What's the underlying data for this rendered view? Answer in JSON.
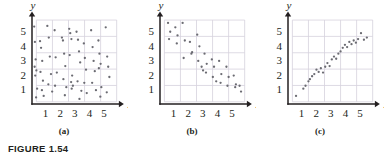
{
  "figure": {
    "caption": "FIGURE 1.54",
    "axis_labels": {
      "x": "x",
      "y": "y"
    },
    "tick_labels": [
      "1",
      "2",
      "3",
      "4",
      "5"
    ],
    "colors": {
      "axis": "#231f20",
      "grid": "#d6d2dd",
      "point": "#6b6b72",
      "text": "#231f20"
    }
  },
  "chart_data": [
    {
      "type": "scatter",
      "title": "(a)",
      "panel": "a",
      "description": "No correlation - points scattered randomly",
      "xlabel": "x",
      "ylabel": "y",
      "xlim": [
        0,
        6
      ],
      "ylim": [
        0,
        6
      ],
      "xticks": [
        1,
        2,
        3,
        4,
        5
      ],
      "yticks": [
        1,
        2,
        3,
        4,
        5
      ],
      "grid": true,
      "legend": "none",
      "points": [
        [
          0.15,
          5.3
        ],
        [
          0.2,
          4.25
        ],
        [
          0.25,
          3.05
        ],
        [
          0.18,
          2.55
        ],
        [
          0.3,
          2.3
        ],
        [
          0.22,
          1.95
        ],
        [
          0.35,
          1.05
        ],
        [
          0.28,
          0.45
        ],
        [
          0.55,
          4.3
        ],
        [
          0.62,
          3.85
        ],
        [
          0.7,
          2.95
        ],
        [
          0.58,
          2.2
        ],
        [
          0.75,
          1.6
        ],
        [
          0.68,
          0.95
        ],
        [
          0.8,
          0.55
        ],
        [
          1.05,
          5.35
        ],
        [
          1.15,
          4.55
        ],
        [
          1.22,
          3.25
        ],
        [
          1.3,
          2.05
        ],
        [
          1.12,
          1.35
        ],
        [
          1.38,
          0.85
        ],
        [
          1.55,
          5.05
        ],
        [
          1.62,
          3.2
        ],
        [
          1.7,
          2.15
        ],
        [
          1.58,
          1.25
        ],
        [
          2.05,
          4.55
        ],
        [
          2.12,
          4.35
        ],
        [
          2.2,
          3.45
        ],
        [
          2.28,
          2.6
        ],
        [
          2.15,
          1.7
        ],
        [
          2.35,
          1.15
        ],
        [
          2.25,
          0.6
        ],
        [
          2.55,
          5.15
        ],
        [
          2.62,
          4.85
        ],
        [
          2.7,
          4.45
        ],
        [
          2.58,
          3.35
        ],
        [
          2.75,
          1.95
        ],
        [
          2.68,
          1.5
        ],
        [
          2.8,
          1.25
        ],
        [
          2.72,
          1.05
        ],
        [
          3.05,
          4.95
        ],
        [
          3.15,
          4.4
        ],
        [
          3.22,
          3.6
        ],
        [
          3.3,
          2.85
        ],
        [
          3.12,
          1.55
        ],
        [
          3.38,
          0.9
        ],
        [
          3.25,
          0.35
        ],
        [
          3.55,
          4.15
        ],
        [
          3.62,
          3.15
        ],
        [
          3.7,
          2.35
        ],
        [
          3.58,
          1.45
        ],
        [
          3.75,
          0.75
        ],
        [
          4.05,
          5.05
        ],
        [
          4.15,
          3.9
        ],
        [
          4.22,
          2.95
        ],
        [
          4.3,
          2.25
        ],
        [
          4.12,
          1.45
        ],
        [
          4.38,
          0.95
        ],
        [
          4.55,
          4.35
        ],
        [
          4.62,
          3.45
        ],
        [
          4.7,
          2.75
        ],
        [
          4.58,
          2.45
        ],
        [
          4.75,
          1.15
        ],
        [
          4.68,
          0.5
        ],
        [
          5.05,
          5.25
        ],
        [
          5.15,
          3.25
        ],
        [
          5.22,
          2.55
        ],
        [
          5.3,
          1.85
        ],
        [
          5.12,
          0.8
        ]
      ]
    },
    {
      "type": "scatter",
      "title": "(b)",
      "panel": "b",
      "description": "Negative correlation - points trend downward left to right",
      "xlabel": "x",
      "ylabel": "y",
      "xlim": [
        0,
        6
      ],
      "ylim": [
        0,
        6
      ],
      "xticks": [
        1,
        2,
        3,
        4,
        5
      ],
      "yticks": [
        1,
        2,
        3,
        4,
        5
      ],
      "grid": true,
      "legend": "none",
      "points": [
        [
          0.55,
          5.55
        ],
        [
          0.7,
          4.95
        ],
        [
          0.62,
          4.45
        ],
        [
          1.05,
          5.25
        ],
        [
          1.2,
          4.7
        ],
        [
          1.15,
          4.15
        ],
        [
          1.55,
          5.55
        ],
        [
          1.7,
          4.35
        ],
        [
          1.62,
          3.15
        ],
        [
          2.05,
          4.25
        ],
        [
          2.2,
          3.55
        ],
        [
          2.15,
          3.45
        ],
        [
          2.55,
          4.75
        ],
        [
          2.7,
          3.95
        ],
        [
          2.62,
          2.95
        ],
        [
          2.85,
          2.55
        ],
        [
          2.95,
          2.3
        ],
        [
          3.05,
          3.45
        ],
        [
          3.2,
          2.75
        ],
        [
          3.15,
          2.15
        ],
        [
          3.55,
          3.05
        ],
        [
          3.7,
          2.55
        ],
        [
          3.62,
          1.85
        ],
        [
          3.85,
          1.55
        ],
        [
          4.05,
          2.95
        ],
        [
          4.2,
          2.05
        ],
        [
          4.15,
          1.45
        ],
        [
          4.55,
          2.55
        ],
        [
          4.7,
          1.85
        ],
        [
          4.62,
          1.25
        ],
        [
          5.05,
          1.95
        ],
        [
          5.2,
          1.35
        ],
        [
          5.15,
          1.15
        ],
        [
          5.45,
          1.25
        ],
        [
          5.55,
          0.85
        ]
      ]
    },
    {
      "type": "scatter",
      "title": "(c)",
      "panel": "c",
      "description": "Strong positive correlation - points trend upward left to right",
      "xlabel": "x",
      "ylabel": "y",
      "xlim": [
        0,
        6
      ],
      "ylim": [
        0,
        6
      ],
      "xticks": [
        1,
        2,
        3,
        4,
        5
      ],
      "yticks": [
        1,
        2,
        3,
        4,
        5
      ],
      "grid": true,
      "legend": "none",
      "points": [
        [
          0.55,
          0.55
        ],
        [
          1.05,
          1.05
        ],
        [
          1.2,
          1.25
        ],
        [
          1.4,
          1.55
        ],
        [
          1.5,
          1.7
        ],
        [
          1.65,
          1.9
        ],
        [
          1.8,
          2.05
        ],
        [
          1.95,
          2.35
        ],
        [
          2.1,
          2.2
        ],
        [
          2.25,
          2.45
        ],
        [
          2.4,
          2.15
        ],
        [
          2.55,
          2.55
        ],
        [
          2.7,
          2.8
        ],
        [
          2.85,
          2.6
        ],
        [
          3.0,
          3.05
        ],
        [
          3.15,
          3.25
        ],
        [
          3.3,
          3.1
        ],
        [
          3.45,
          3.45
        ],
        [
          3.6,
          3.6
        ],
        [
          3.75,
          3.85
        ],
        [
          3.9,
          4.05
        ],
        [
          4.05,
          3.9
        ],
        [
          4.2,
          4.25
        ],
        [
          4.35,
          4.1
        ],
        [
          4.5,
          4.35
        ],
        [
          4.65,
          4.2
        ],
        [
          4.8,
          4.45
        ],
        [
          5.0,
          4.85
        ],
        [
          5.2,
          4.4
        ],
        [
          5.4,
          4.55
        ]
      ]
    }
  ]
}
